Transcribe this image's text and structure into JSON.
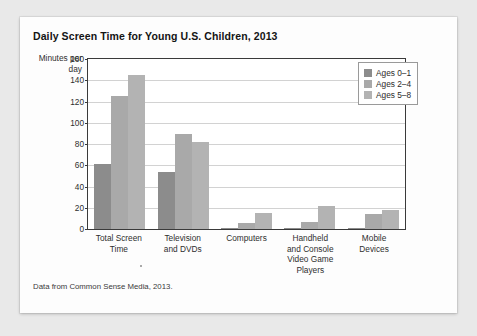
{
  "card": {
    "title": "Daily Screen Time for Young U.S. Children, 2013",
    "source_note": "Data from Common Sense Media, 2013."
  },
  "chart_data": {
    "type": "bar",
    "title": "Daily Screen Time for Young U.S. Children, 2013",
    "xlabel": "",
    "ylabel": "Minutes per day",
    "ylim": [
      0,
      160
    ],
    "yticks": [
      0,
      20,
      40,
      60,
      80,
      100,
      120,
      140,
      160
    ],
    "grid": true,
    "legend_position": "top-right",
    "categories": [
      "Total Screen\nTime",
      "Television\nand DVDs",
      "Computers",
      "Handheld\nand Console\nVideo Game\nPlayers",
      "Mobile\nDevices"
    ],
    "series": [
      {
        "name": "Ages 0–1",
        "color": "#8c8c8c",
        "values": [
          61,
          54,
          1,
          0.5,
          1
        ]
      },
      {
        "name": "Ages 2–4",
        "color": "#a9a9a9",
        "values": [
          125,
          89,
          6,
          7,
          14
        ]
      },
      {
        "name": "Ages 5–8",
        "color": "#b3b3b3",
        "values": [
          145,
          82,
          15,
          22,
          18
        ]
      }
    ],
    "units": "minutes per day"
  }
}
